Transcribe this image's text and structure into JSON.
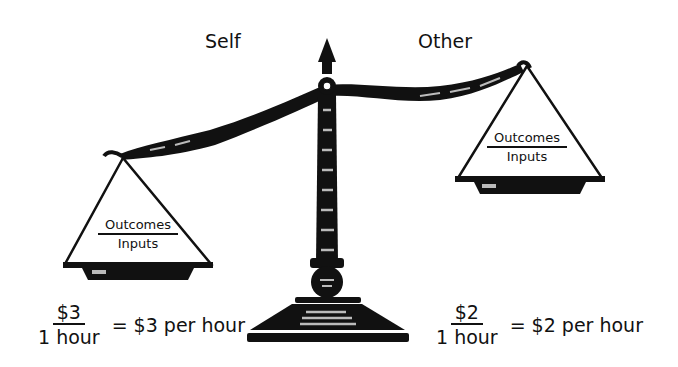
{
  "labels": {
    "left_side": "Self",
    "right_side": "Other"
  },
  "pans": {
    "left": {
      "numerator": "Outcomes",
      "denominator": "Inputs"
    },
    "right": {
      "numerator": "Outcomes",
      "denominator": "Inputs"
    }
  },
  "equations": {
    "self": {
      "numerator": "$3",
      "denominator": "1 hour",
      "result": "= $3 per hour"
    },
    "other": {
      "numerator": "$2",
      "denominator": "1 hour",
      "result": "= $2 per hour"
    }
  },
  "colors": {
    "ink": "#111111",
    "highlight": "#bbbbbb",
    "background": "#ffffff"
  }
}
